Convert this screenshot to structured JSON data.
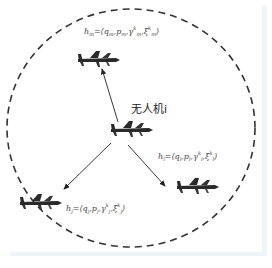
{
  "diagram": {
    "type": "uav-communication-range",
    "circle": {
      "style": "dashed",
      "color": "#333333",
      "cx": 131,
      "cy": 128,
      "rx": 124,
      "ry": 119
    },
    "nodes": [
      {
        "id": "m",
        "icon": "drone-icon",
        "x": 100,
        "y": 60
      },
      {
        "id": "i",
        "icon": "drone-icon",
        "x": 130,
        "y": 132
      },
      {
        "id": "l",
        "icon": "drone-icon",
        "x": 195,
        "y": 189
      },
      {
        "id": "j",
        "icon": "drone-icon",
        "x": 37,
        "y": 203
      }
    ],
    "edges": [
      {
        "from": "i",
        "to": "m"
      },
      {
        "from": "i",
        "to": "j"
      },
      {
        "from": "i",
        "to": "l"
      }
    ],
    "labels": {
      "center": "无人机i",
      "m": {
        "h": "h",
        "sub": "m",
        "eq": "=⟨q",
        "sub_q": "m",
        "p": ",p",
        "sub_p": "m",
        "gamma": ",γ",
        "gamma_sup": "k",
        "gamma_sub": "m",
        "xi": ",ξ",
        "xi_sup": "k",
        "xi_sub": "m",
        "close": "⟩"
      },
      "l": {
        "h": "h",
        "sub": "l",
        "eq": "=⟨q",
        "sub_q": "l",
        "p": ",p",
        "sub_p": "l",
        "gamma": ",γ",
        "gamma_sup": "k",
        "gamma_sub": "l",
        "xi": ",ξ",
        "xi_sup": "k",
        "xi_sub": "l",
        "close": "⟩"
      },
      "j": {
        "h": "h",
        "sub": "j",
        "eq": "=⟨q",
        "sub_q": "j",
        "p": ",p",
        "sub_p": "j",
        "gamma": ",γ",
        "gamma_sup": "k",
        "gamma_sub": "j",
        "xi": ",ξ",
        "xi_sup": "k",
        "xi_sub": "j",
        "close": "⟩"
      }
    }
  }
}
